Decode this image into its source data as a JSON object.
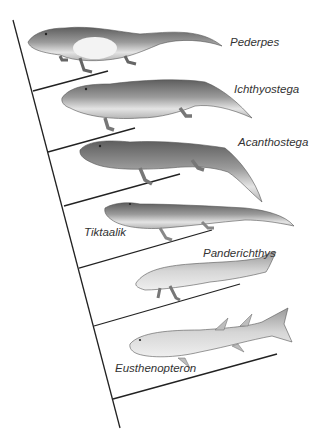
{
  "colors": {
    "line": "#222222",
    "animal_dark": "#6d6d6d",
    "animal_mid": "#a3a3a3",
    "animal_light": "#e3e3e3",
    "text": "#333333"
  },
  "taxa": [
    {
      "name": "Pederpes",
      "type": "tetrapod"
    },
    {
      "name": "Ichthyostega",
      "type": "tetrapod"
    },
    {
      "name": "Acanthostega",
      "type": "tetrapod"
    },
    {
      "name": "Tiktaalik",
      "type": "fishapod"
    },
    {
      "name": "Panderichthys",
      "type": "lobe-finned fish"
    },
    {
      "name": "Eusthenopteron",
      "type": "lobe-finned fish"
    }
  ]
}
